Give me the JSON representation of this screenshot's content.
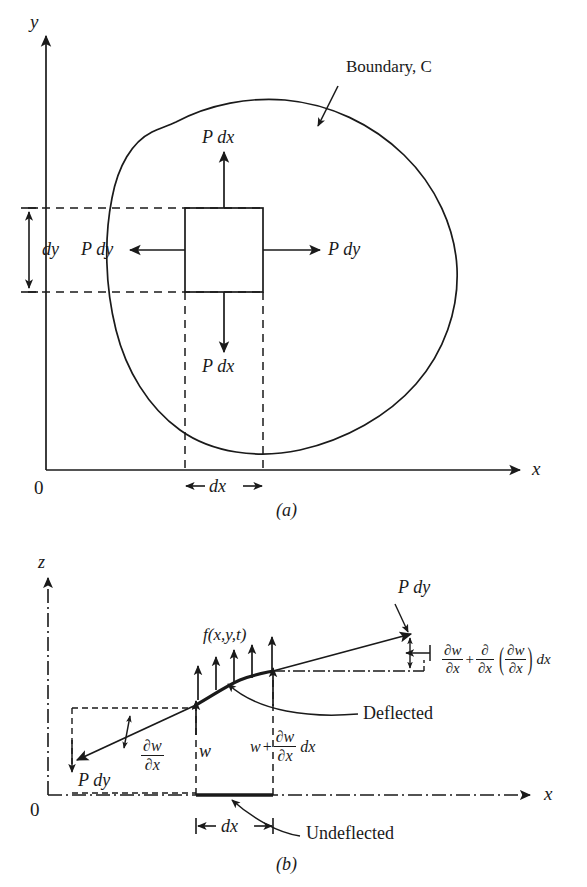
{
  "figure": {
    "title_a": "(a)",
    "title_b": "(b)",
    "panels": [
      {
        "id": "a",
        "caption": "(a)",
        "description": "Plan view of an arbitrary plate region bounded by curve C, with a differential element dx by dy and in-plane tension forces P dx and P dy acting on its four edges.",
        "axes": {
          "x_label": "x",
          "y_label": "y",
          "origin_label": "0"
        },
        "labels": {
          "boundary": "Boundary, C",
          "force_top": "P dx",
          "force_bottom": "P dx",
          "force_left": "P dy",
          "force_right": "P dy",
          "dim_dy": "dy",
          "dim_dx": "dx"
        }
      },
      {
        "id": "b",
        "caption": "(b)",
        "description": "Side (x-z) view of the differential element showing the undeflected and deflected positions, transverse load f(x,y,t) and the slopes at the two ends.",
        "axes": {
          "x_label": "x",
          "z_label": "z",
          "origin_label": "0"
        },
        "labels": {
          "load": "f(x,y,t)",
          "force_left": "P dy",
          "force_right": "P dy",
          "deflection_left": "w",
          "dim_dx": "dx",
          "deflected": "Deflected",
          "undeflected": "Undeflected"
        },
        "equations": {
          "slope_left": {
            "numerator": "∂w",
            "denominator": "∂x"
          },
          "deflection_right": {
            "lead": "w",
            "plus": "+",
            "numerator": "∂w",
            "denominator": "∂x",
            "trail": "dx"
          },
          "slope_right": {
            "term1_num": "∂w",
            "term1_den": "∂x",
            "plus": "+",
            "term2_num": "∂",
            "term2_den": "∂x",
            "paren_open": "(",
            "term3_num": "∂w",
            "term3_den": "∂x",
            "paren_close": ")",
            "trail": "dx"
          }
        }
      }
    ],
    "colors": {
      "ink": "#1a1a1a",
      "background": "#ffffff"
    }
  }
}
